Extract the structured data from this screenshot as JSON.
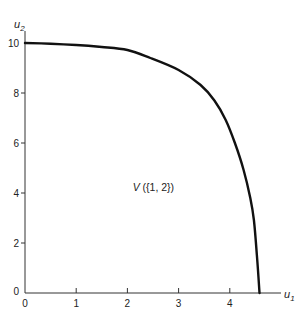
{
  "chart_data": {
    "type": "line",
    "title": "",
    "xlabel": "u1",
    "ylabel": "u2",
    "xlabel_main": "u",
    "xlabel_sub": "1",
    "ylabel_main": "u",
    "ylabel_sub": "2",
    "xlim": [
      0,
      5.1
    ],
    "ylim": [
      0,
      10.8
    ],
    "grid": false,
    "legend": null,
    "x_ticks": [
      0,
      1,
      2,
      3,
      4
    ],
    "y_ticks": [
      0,
      2,
      4,
      6,
      8,
      10
    ],
    "x_tick_labels": [
      "0",
      "1",
      "2",
      "3",
      "4"
    ],
    "y_tick_labels": [
      "0",
      "2",
      "4",
      "6",
      "8",
      "10"
    ],
    "annotation": "V({1, 2})",
    "annotation_position": {
      "x": 2.2,
      "y": 4.1
    },
    "series": [
      {
        "name": "Pareto frontier of V({1,2})",
        "x": [
          0,
          0.5,
          1.0,
          1.5,
          2.0,
          2.45,
          3.0,
          3.43,
          3.7,
          3.92,
          4.1,
          4.27,
          4.4,
          4.47,
          4.53,
          4.58
        ],
        "y": [
          10,
          9.97,
          9.92,
          9.84,
          9.72,
          9.4,
          8.92,
          8.32,
          7.7,
          6.92,
          6.0,
          4.92,
          3.8,
          2.92,
          1.5,
          0
        ]
      }
    ],
    "colors": {
      "curve": "#111111",
      "axes": "#333333"
    }
  }
}
